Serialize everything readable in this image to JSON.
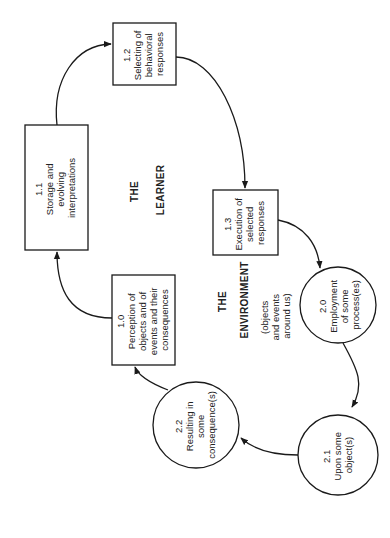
{
  "diagram": {
    "orientation": "rotated -90deg",
    "regions": {
      "learner": {
        "line1": "THE",
        "line2": "LEARNER"
      },
      "environment": {
        "line1": "THE",
        "line2": "ENVIRONMENT"
      },
      "environment_note": {
        "line1": "(objects",
        "line2": "and events",
        "line3": "around us)"
      }
    },
    "boxes": [
      {
        "id": "1.0",
        "lines": [
          "1.0",
          "Perception of",
          "objects and of",
          "events and their",
          "consequences"
        ]
      },
      {
        "id": "1.1",
        "lines": [
          "1.1",
          "Storage and",
          "evolving",
          "interpretations"
        ]
      },
      {
        "id": "1.2",
        "lines": [
          "1.2",
          "Selecting of",
          "behavioral",
          "responses"
        ]
      },
      {
        "id": "1.3",
        "lines": [
          "1.3",
          "Execution of",
          "selected",
          "responses"
        ]
      }
    ],
    "circles": [
      {
        "id": "2.0",
        "lines": [
          "2.0",
          "Employment",
          "of some",
          "process(es)"
        ]
      },
      {
        "id": "2.1",
        "lines": [
          "2.1",
          "Upon some",
          "object(s)"
        ]
      },
      {
        "id": "2.2",
        "lines": [
          "2.2",
          "Resulting in",
          "some",
          "consequence(s)"
        ]
      }
    ],
    "flow": [
      "1.0",
      "1.1",
      "1.2",
      "1.3",
      "2.0",
      "2.1",
      "2.2",
      "1.0"
    ]
  }
}
